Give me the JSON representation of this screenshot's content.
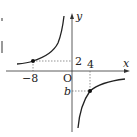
{
  "diagram": {
    "type": "inverse-proportion-graph",
    "axes": {
      "x_label": "x",
      "y_label": "y",
      "origin_label": "O"
    },
    "points": [
      {
        "x": -8,
        "y": 2,
        "x_label": "−8",
        "y_label": "2"
      },
      {
        "x": 4,
        "y_symbol": "b",
        "x_label": "4",
        "y_label": "b"
      }
    ],
    "colors": {
      "curve": "#222222",
      "axis": "#333333",
      "guide": "#666666"
    }
  }
}
